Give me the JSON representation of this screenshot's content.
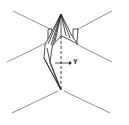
{
  "diagram": {
    "type": "origami-fold-step",
    "labels": {
      "axis_label": "Y"
    },
    "colors": {
      "line": "#222222",
      "background": "#ffffff"
    }
  }
}
